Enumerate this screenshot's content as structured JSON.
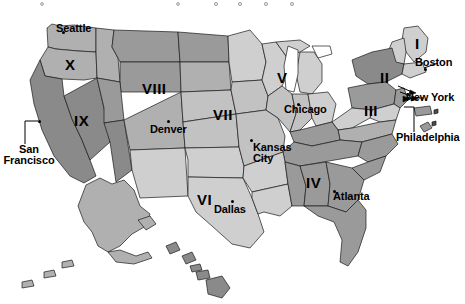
{
  "map": {
    "title": "United States Federal Reserve Districts Map",
    "projection": "contiguous-us-with-insets",
    "background_color": "#ffffff",
    "outline_color": "#1a1a1a",
    "palette": {
      "very_light": "#e2e2e2",
      "light": "#cfcfcf",
      "medium_light": "#c2c2c2",
      "medium": "#b0b0b0",
      "medium_dark": "#9a9a9a",
      "dark": "#8a8a8a",
      "lake_white": "#ffffff"
    }
  },
  "districts": [
    {
      "id": "I",
      "label": "I",
      "x": 415,
      "y": 44,
      "shade": "#cfcfcf",
      "region": "New England"
    },
    {
      "id": "II",
      "label": "II",
      "x": 388,
      "y": 78,
      "shade": "#8a8a8a",
      "region": "New York"
    },
    {
      "id": "III",
      "label": "III",
      "x": 372,
      "y": 111,
      "shade": "#9a9a9a",
      "region": "Philadelphia"
    },
    {
      "id": "IV",
      "label": "IV",
      "x": 314,
      "y": 183,
      "shade": "#9a9a9a",
      "region": "Cleveland"
    },
    {
      "id": "V",
      "label": "V",
      "x": 281,
      "y": 78,
      "shade": "#cfcfcf",
      "region": "Richmond"
    },
    {
      "id": "VI",
      "label": "VI",
      "x": 205,
      "y": 200,
      "shade": "#cfcfcf",
      "region": "Atlanta"
    },
    {
      "id": "VII",
      "label": "VII",
      "x": 223,
      "y": 115,
      "shade": "#c2c2c2",
      "region": "Chicago"
    },
    {
      "id": "VIII",
      "label": "VIII",
      "x": 154,
      "y": 89,
      "shade": "#b0b0b0",
      "region": "St. Louis"
    },
    {
      "id": "IX",
      "label": "IX",
      "x": 81,
      "y": 121,
      "shade": "#8a8a8a",
      "region": "Minneapolis"
    },
    {
      "id": "X",
      "label": "X",
      "x": 70,
      "y": 65,
      "shade": "#b0b0b0",
      "region": "Kansas City"
    }
  ],
  "cities": [
    {
      "name": "Seattle",
      "label": "Seattle",
      "dot_x": 62,
      "dot_y": 31,
      "label_x": 58,
      "label_y": 34,
      "align": "left",
      "leader": false
    },
    {
      "name": "San Francisco",
      "label": "San\nFrancisco",
      "dot_x": 38,
      "dot_y": 121,
      "label_x": 18,
      "label_y": 150,
      "align": "center",
      "leader": true
    },
    {
      "name": "Denver",
      "label": "Denver",
      "dot_x": 167,
      "dot_y": 120,
      "label_x": 152,
      "label_y": 124,
      "align": "left",
      "leader": false
    },
    {
      "name": "Dallas",
      "label": "Dallas",
      "dot_x": 231,
      "dot_y": 200,
      "label_x": 216,
      "label_y": 204,
      "align": "left",
      "leader": false
    },
    {
      "name": "Kansas City",
      "label": "Kansas\nCity",
      "dot_x": 252,
      "dot_y": 139,
      "label_x": 253,
      "label_y": 142,
      "align": "left",
      "leader": false
    },
    {
      "name": "Chicago",
      "label": "Chicago",
      "dot_x": 297,
      "dot_y": 103,
      "label_x": 285,
      "label_y": 106,
      "align": "left",
      "leader": false
    },
    {
      "name": "Atlanta",
      "label": "Atlanta",
      "dot_x": 336,
      "dot_y": 190,
      "label_x": 334,
      "label_y": 193,
      "align": "left",
      "leader": false
    },
    {
      "name": "Boston",
      "label": "Boston",
      "dot_x": 424,
      "dot_y": 68,
      "label_x": 418,
      "label_y": 64,
      "align": "left",
      "leader": true
    },
    {
      "name": "New York",
      "label": "New York",
      "dot_x": 408,
      "dot_y": 98,
      "label_x": 410,
      "label_y": 101,
      "align": "left",
      "leader": true
    },
    {
      "name": "Philadelphia",
      "label": "Philadelphia",
      "dot_x": 404,
      "dot_y": 107,
      "label_x": 400,
      "label_y": 138,
      "align": "left",
      "leader": true
    }
  ],
  "insets": [
    {
      "name": "alaska",
      "label": "Alaska",
      "shade": "#b0b0b0"
    },
    {
      "name": "hawaii",
      "label": "Hawaii",
      "shade": "#8a8a8a"
    }
  ]
}
